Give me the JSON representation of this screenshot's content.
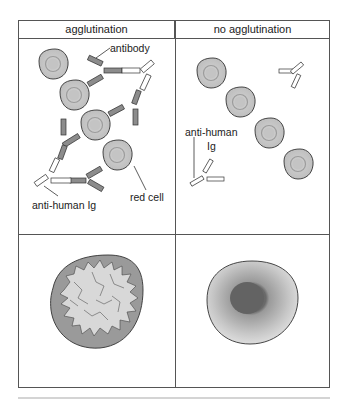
{
  "figure": {
    "columns": [
      {
        "header": "agglutination"
      },
      {
        "header": "no agglutination"
      }
    ],
    "top_left_labels": {
      "antibody": "antibody",
      "red_cell": "red cell",
      "anti_human_ig": "anti-human Ig"
    },
    "top_right_labels": {
      "anti_human_line1": "anti-human",
      "anti_human_line2": "Ig"
    },
    "colors": {
      "cell_fill": "#c8c8c8",
      "cell_inner": "#b4b4b4",
      "antibody_fill": "#8c8c8c",
      "anti_ig_fill": "#ffffff",
      "agglutinated_cell": "#9a9a9a",
      "dispersed_spot": "#6e6e6e",
      "border": "#555555"
    }
  }
}
